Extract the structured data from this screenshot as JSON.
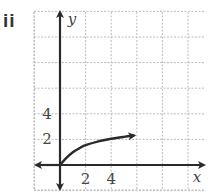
{
  "figure": {
    "label": "ii"
  },
  "chart_data": {
    "type": "line",
    "title": "",
    "xlabel": "x",
    "ylabel": "y",
    "xlim": [
      -1,
      5.8
    ],
    "ylim": [
      -1,
      6
    ],
    "grid": true,
    "x_ticks": [
      {
        "value": 2,
        "label": "2"
      },
      {
        "value": 4,
        "label": "4"
      }
    ],
    "y_ticks": [
      {
        "value": 2,
        "label": "2"
      },
      {
        "value": 4,
        "label": "4"
      }
    ],
    "series": [
      {
        "name": "curve",
        "description": "increasing, concave-down curve starting at the origin and leveling off toward y≈2.5, arrow at right end",
        "x": [
          0,
          0.5,
          1,
          1.5,
          2,
          3,
          4,
          5,
          5.8
        ],
        "y": [
          0,
          0.55,
          1.0,
          1.3,
          1.55,
          1.85,
          2.05,
          2.2,
          2.3
        ]
      }
    ],
    "colors": {
      "axis": "#2a2a2a",
      "curve": "#2a2a2a",
      "grid": "#bbbbbb"
    }
  }
}
